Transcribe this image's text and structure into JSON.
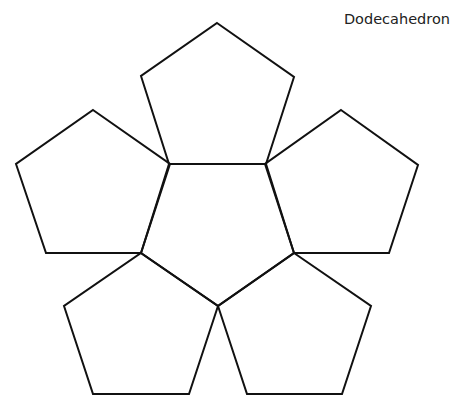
{
  "title": "Dodecahedron",
  "diagram": {
    "type": "net",
    "stroke_color": "#111111",
    "faces": [
      {
        "name": "center",
        "points": "169,164 266,164 294,253 218,306 141,253"
      },
      {
        "name": "top",
        "points": "217,23 294,77 266,164 169,164 141,76"
      },
      {
        "name": "left",
        "points": "93,110 170,164 141,253 46,253 16,164"
      },
      {
        "name": "right",
        "points": "341,110 418,165 389,253 294,253 265,164"
      },
      {
        "name": "bottom-left",
        "points": "141,253 218,306 189,394 93,394 64,306"
      },
      {
        "name": "bottom-right",
        "points": "294,253 371,306 342,394 247,394 218,306"
      }
    ]
  }
}
